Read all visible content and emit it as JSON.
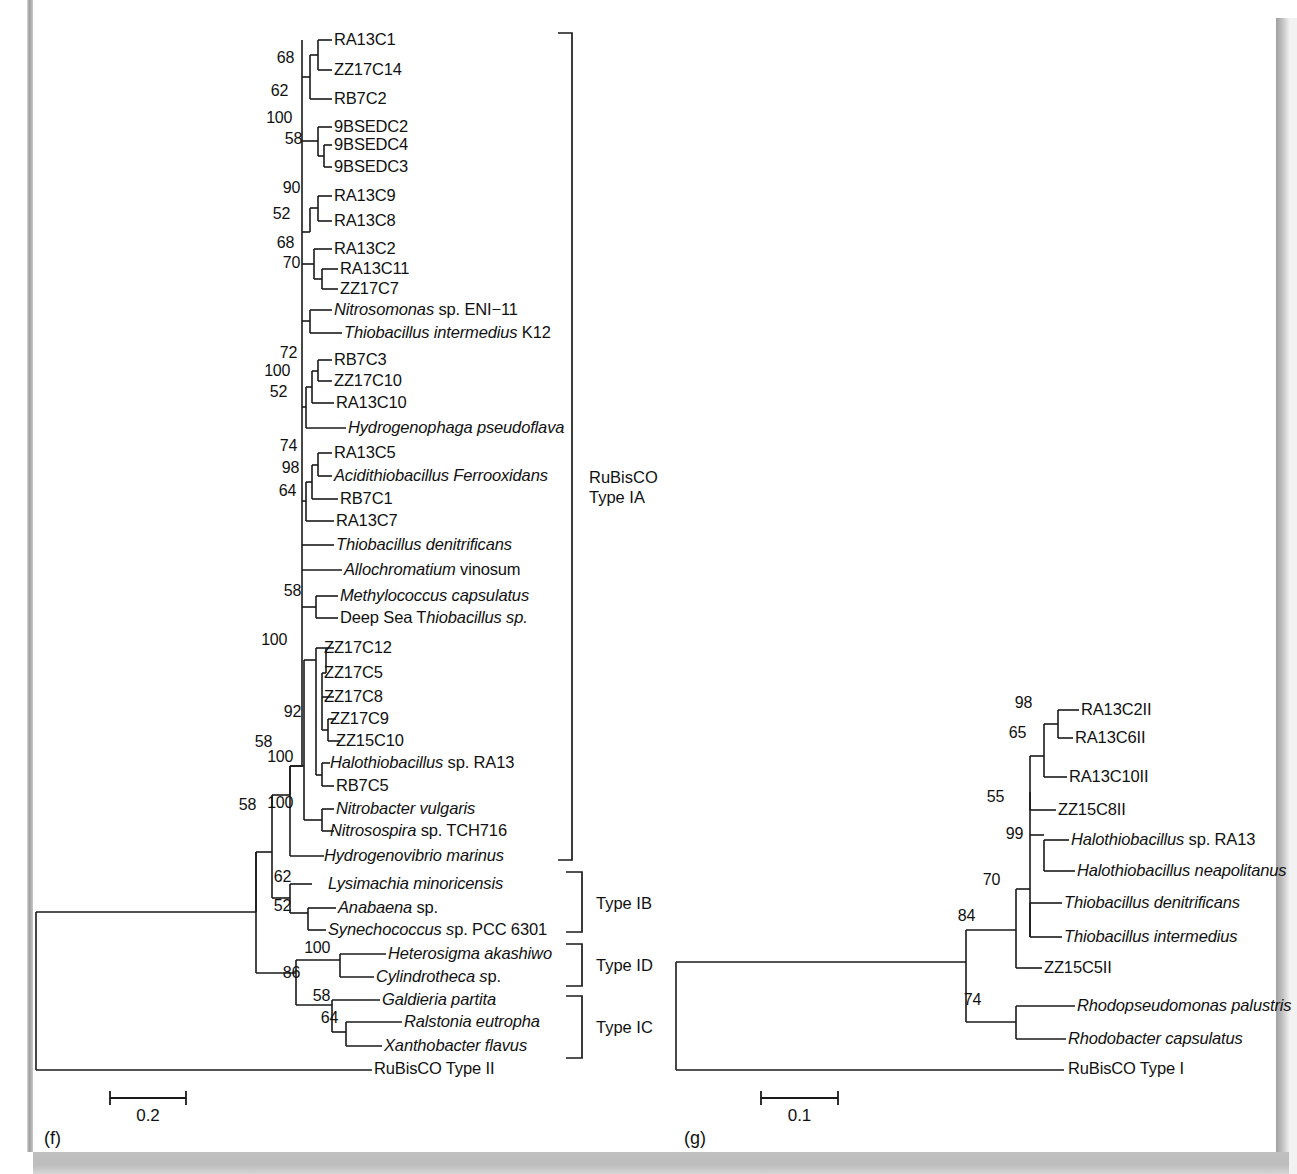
{
  "figure": {
    "background": "#ffffff",
    "ink": "#1a1a1a",
    "edge_band_color": "#b8b8b8"
  },
  "panels": [
    {
      "id": "f",
      "label": "(f)",
      "scale_bar": {
        "value": "0.2",
        "x1": 110,
        "x2": 186,
        "y": 1098
      },
      "group_brackets": [
        {
          "name": "RuBisCO Type IA",
          "line1": "RuBisCO",
          "line2": "Type IA",
          "x": 572,
          "y_top": 33,
          "y_bottom": 860,
          "text_x": 589,
          "text_y": 467
        },
        {
          "name": "Type IB",
          "line1": "Type IB",
          "line2": "",
          "x": 582,
          "y_top": 872,
          "y_bottom": 932,
          "text_x": 596,
          "text_y": 893
        },
        {
          "name": "Type ID",
          "line1": "Type ID",
          "line2": "",
          "x": 582,
          "y_top": 944,
          "y_bottom": 986,
          "text_x": 596,
          "text_y": 955
        },
        {
          "name": "Type IC",
          "line1": "Type IC",
          "line2": "",
          "x": 582,
          "y_top": 996,
          "y_bottom": 1058,
          "text_x": 596,
          "text_y": 1017
        }
      ],
      "leaves": [
        {
          "name": "RA13C1",
          "italic": false,
          "y": 40,
          "x": 334
        },
        {
          "name": "ZZ17C14",
          "italic": false,
          "y": 70,
          "x": 334
        },
        {
          "name": "RB7C2",
          "italic": false,
          "y": 99,
          "x": 334
        },
        {
          "name": "9BSEDC2",
          "italic": false,
          "y": 127,
          "x": 334
        },
        {
          "name": "9BSEDC4",
          "italic": false,
          "y": 145,
          "x": 334
        },
        {
          "name": "9BSEDC3",
          "italic": false,
          "y": 167,
          "x": 334
        },
        {
          "name": "RA13C9",
          "italic": false,
          "y": 196,
          "x": 334
        },
        {
          "name": "RA13C8",
          "italic": false,
          "y": 221,
          "x": 334
        },
        {
          "name": "RA13C2",
          "italic": false,
          "y": 249,
          "x": 334
        },
        {
          "name": "RA13C11",
          "italic": false,
          "y": 269,
          "x": 340
        },
        {
          "name": "ZZ17C7",
          "italic": false,
          "y": 289,
          "x": 340
        },
        {
          "name": "Nitrosomonas sp. ENI−11",
          "italic": true,
          "roman_from": 12,
          "y": 310,
          "x": 334
        },
        {
          "name": "Thiobacillus intermedius K12",
          "italic": true,
          "roman_from": 24,
          "y": 333,
          "x": 344
        },
        {
          "name": "RB7C3",
          "italic": false,
          "y": 360,
          "x": 334
        },
        {
          "name": "ZZ17C10",
          "italic": false,
          "y": 381,
          "x": 334
        },
        {
          "name": "RA13C10",
          "italic": false,
          "y": 403,
          "x": 336
        },
        {
          "name": "Hydrogenophaga pseudoflava",
          "italic": true,
          "y": 428,
          "x": 348
        },
        {
          "name": "RA13C5",
          "italic": false,
          "y": 453,
          "x": 334
        },
        {
          "name": "Acidithiobacillus Ferrooxidans",
          "italic": true,
          "y": 476,
          "x": 334
        },
        {
          "name": "RB7C1",
          "italic": false,
          "y": 499,
          "x": 340
        },
        {
          "name": "RA13C7",
          "italic": false,
          "y": 521,
          "x": 336
        },
        {
          "name": "Thiobacillus denitrificans",
          "italic": true,
          "y": 545,
          "x": 336
        },
        {
          "name": "Allochromatium vinosum",
          "italic": true,
          "roman_from": 15,
          "y": 570,
          "x": 344
        },
        {
          "name": "Methylococcus capsulatus",
          "italic": true,
          "y": 596,
          "x": 340
        },
        {
          "name": "Deep Sea Thiobacillus sp.",
          "italic": true,
          "roman_until": 10,
          "y": 618,
          "x": 340
        },
        {
          "name": "ZZ17C12",
          "italic": false,
          "y": 648,
          "x": 324
        },
        {
          "name": "ZZ17C5",
          "italic": false,
          "y": 673,
          "x": 324
        },
        {
          "name": "ZZ17C8",
          "italic": false,
          "y": 697,
          "x": 324
        },
        {
          "name": "ZZ17C9",
          "italic": false,
          "y": 719,
          "x": 330
        },
        {
          "name": "ZZ15C10",
          "italic": false,
          "y": 741,
          "x": 336
        },
        {
          "name": "Halothiobacillus sp. RA13",
          "italic": true,
          "roman_from": 17,
          "y": 763,
          "x": 330
        },
        {
          "name": "RB7C5",
          "italic": false,
          "y": 786,
          "x": 336
        },
        {
          "name": "Nitrobacter vulgaris",
          "italic": true,
          "y": 809,
          "x": 336
        },
        {
          "name": "Nitrosospira sp. TCH716",
          "italic": true,
          "roman_from": 13,
          "y": 831,
          "x": 330
        },
        {
          "name": "Hydrogenovibrio marinus",
          "italic": true,
          "y": 856,
          "x": 324
        },
        {
          "name": "Lysimachia minoricensis",
          "italic": true,
          "y": 884,
          "x": 328
        },
        {
          "name": "Anabaena sp.",
          "italic": true,
          "roman_from": 9,
          "y": 908,
          "x": 338
        },
        {
          "name": "Synechococcus sp. PCC 6301",
          "italic": true,
          "roman_from": 15,
          "y": 930,
          "x": 328
        },
        {
          "name": "Heterosigma akashiwo",
          "italic": true,
          "y": 954,
          "x": 388
        },
        {
          "name": "Cylindrotheca sp.",
          "italic": true,
          "roman_from": 15,
          "y": 977,
          "x": 376
        },
        {
          "name": "Galdieria partita",
          "italic": true,
          "y": 1000,
          "x": 382
        },
        {
          "name": "Ralstonia eutropha",
          "italic": true,
          "y": 1022,
          "x": 404
        },
        {
          "name": "Xanthobacter flavus",
          "italic": true,
          "y": 1046,
          "x": 384
        },
        {
          "name": "RuBisCO Type II",
          "italic": false,
          "y": 1069,
          "x": 374
        }
      ],
      "bootstraps": [
        {
          "value": "68",
          "x": 294,
          "y": 58
        },
        {
          "value": "62",
          "x": 288,
          "y": 91
        },
        {
          "value": "100",
          "x": 292,
          "y": 118
        },
        {
          "value": "58",
          "x": 302,
          "y": 139
        },
        {
          "value": "90",
          "x": 300,
          "y": 188
        },
        {
          "value": "52",
          "x": 290,
          "y": 214
        },
        {
          "value": "68",
          "x": 294,
          "y": 243
        },
        {
          "value": "70",
          "x": 300,
          "y": 263
        },
        {
          "value": "72",
          "x": 297,
          "y": 353
        },
        {
          "value": "100",
          "x": 290,
          "y": 371
        },
        {
          "value": "52",
          "x": 287,
          "y": 392
        },
        {
          "value": "74",
          "x": 297,
          "y": 446
        },
        {
          "value": "98",
          "x": 299,
          "y": 468
        },
        {
          "value": "64",
          "x": 296,
          "y": 491
        },
        {
          "value": "58",
          "x": 301,
          "y": 591
        },
        {
          "value": "100",
          "x": 287,
          "y": 640
        },
        {
          "value": "92",
          "x": 301,
          "y": 712
        },
        {
          "value": "58",
          "x": 272,
          "y": 742
        },
        {
          "value": "100",
          "x": 293,
          "y": 757
        },
        {
          "value": "100",
          "x": 293,
          "y": 803
        },
        {
          "value": "58",
          "x": 256,
          "y": 805
        },
        {
          "value": "62",
          "x": 291,
          "y": 877
        },
        {
          "value": "52",
          "x": 291,
          "y": 906
        },
        {
          "value": "100",
          "x": 330,
          "y": 948
        },
        {
          "value": "86",
          "x": 300,
          "y": 973
        },
        {
          "value": "58",
          "x": 330,
          "y": 996
        },
        {
          "value": "64",
          "x": 338,
          "y": 1018
        }
      ]
    },
    {
      "id": "g",
      "label": "(g)",
      "scale_bar": {
        "value": "0.1",
        "x1": 761,
        "x2": 838,
        "y": 1098
      },
      "leaves": [
        {
          "name": "RA13C2II",
          "italic": false,
          "y": 710,
          "x": 1081
        },
        {
          "name": "RA13C6II",
          "italic": false,
          "y": 738,
          "x": 1075
        },
        {
          "name": "RA13C10II",
          "italic": false,
          "y": 777,
          "x": 1069
        },
        {
          "name": "ZZ15C8II",
          "italic": false,
          "y": 810,
          "x": 1058
        },
        {
          "name": "Halothiobacillus sp. RA13",
          "italic": true,
          "roman_from": 17,
          "y": 840,
          "x": 1071
        },
        {
          "name": "Halothiobacillus neapolitanus",
          "italic": true,
          "y": 871,
          "x": 1077
        },
        {
          "name": "Thiobacillus denitrificans",
          "italic": true,
          "y": 903,
          "x": 1064
        },
        {
          "name": "Thiobacillus intermedius",
          "italic": true,
          "y": 937,
          "x": 1064
        },
        {
          "name": "ZZ15C5II",
          "italic": false,
          "y": 968,
          "x": 1044
        },
        {
          "name": "Rhodopseudomonas palustris",
          "italic": true,
          "y": 1006,
          "x": 1077
        },
        {
          "name": "Rhodobacter capsulatus",
          "italic": true,
          "y": 1039,
          "x": 1068
        },
        {
          "name": "RuBisCO Type I",
          "italic": false,
          "y": 1069,
          "x": 1068
        }
      ],
      "bootstraps": [
        {
          "value": "98",
          "x": 1032,
          "y": 703
        },
        {
          "value": "65",
          "x": 1026,
          "y": 733
        },
        {
          "value": "55",
          "x": 1004,
          "y": 797
        },
        {
          "value": "99",
          "x": 1023,
          "y": 834
        },
        {
          "value": "70",
          "x": 1000,
          "y": 880
        },
        {
          "value": "84",
          "x": 975,
          "y": 916
        },
        {
          "value": "74",
          "x": 981,
          "y": 1000
        }
      ]
    }
  ]
}
